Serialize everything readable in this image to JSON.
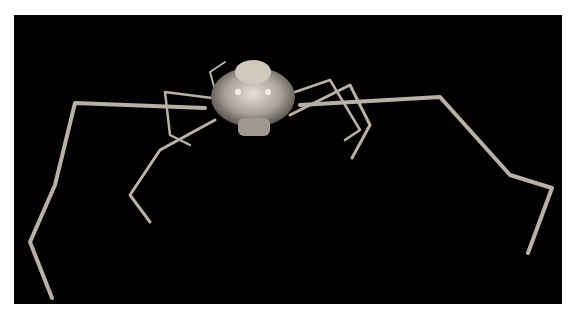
{
  "image": {
    "subject": "long-legged spider crab specimen on black background",
    "background_color": "#020202",
    "page_color": "#ffffff",
    "subject_color": "#bdb6ac"
  }
}
